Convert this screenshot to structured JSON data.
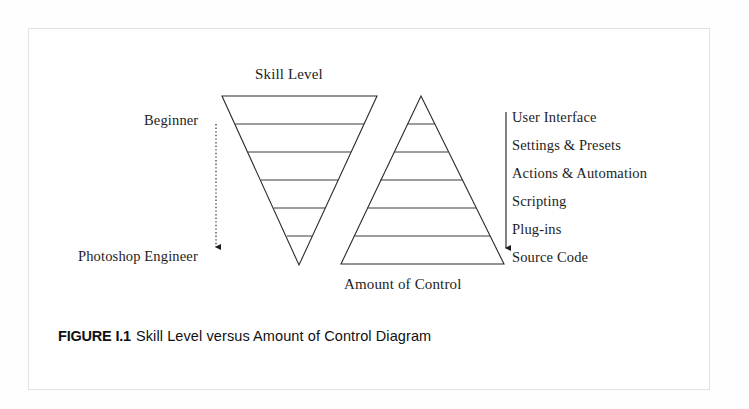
{
  "figure": {
    "caption_number": "FIGURE I.1",
    "caption_text": "Skill Level versus Amount of Control Diagram"
  },
  "diagram": {
    "top_title": "Skill Level",
    "bottom_title": "Amount of Control",
    "left_axis": {
      "top_label": "Beginner",
      "bottom_label": "Photoshop Engineer",
      "arrow_direction": "down",
      "arrow_style": "dotted"
    },
    "right_axis": {
      "arrow_direction": "down",
      "arrow_style": "solid",
      "levels": [
        "User Interface",
        "Settings & Presets",
        "Actions & Automation",
        "Scripting",
        "Plug-ins",
        "Source Code"
      ]
    },
    "left_shape": {
      "name": "inverted-triangle",
      "meaning": "skill level decreasing width downward",
      "band_count": 6
    },
    "right_shape": {
      "name": "upright-pyramid",
      "meaning": "amount of control increasing width downward",
      "band_count": 6
    },
    "colors": {
      "ink": "#1d1d1d",
      "page": "#ffffff",
      "frame": "#e3e3e3"
    }
  }
}
